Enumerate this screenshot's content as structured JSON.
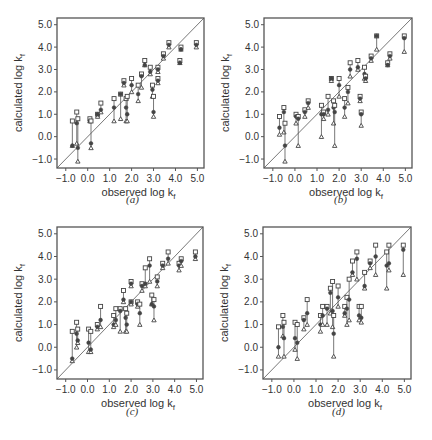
{
  "chart_data": [
    {
      "id": "a",
      "type": "scatter",
      "caption": "(a)",
      "xlabel": "observed log k_f",
      "ylabel": "calculated log k_f",
      "xlim": [
        -1.4,
        5.3
      ],
      "ylim": [
        -1.4,
        5.3
      ],
      "xticks": [
        "-1.0",
        "0.0",
        "1.0",
        "2.0",
        "3.0",
        "4.0",
        "5.0"
      ],
      "yticks": [
        "-1.0",
        "0.0",
        "1.0",
        "2.0",
        "3.0",
        "4.0",
        "5.0"
      ],
      "diagonal": true,
      "grid": false,
      "points": [
        {
          "x": -0.7,
          "hi": 0.7,
          "mid": -0.4,
          "lo": -0.4
        },
        {
          "x": -0.5,
          "hi": 1.1,
          "mid": 0.6,
          "lo": -0.3
        },
        {
          "x": -0.45,
          "hi": 0.8,
          "mid": -0.5,
          "lo": -1.1
        },
        {
          "x": 0.1,
          "hi": 0.8,
          "mid": 0.7,
          "lo": 0.7
        },
        {
          "x": 0.15,
          "hi": 0.7,
          "mid": -0.3,
          "lo": -0.5
        },
        {
          "x": 0.45,
          "hi": 1.0,
          "mid": 1.0,
          "lo": 0.9
        },
        {
          "x": 0.6,
          "hi": 1.5,
          "mid": 1.2,
          "lo": 1.1
        },
        {
          "x": 1.2,
          "hi": 1.7,
          "mid": 1.3,
          "lo": 0.7
        },
        {
          "x": 1.5,
          "hi": 1.9,
          "mid": 1.9,
          "lo": 0.8
        },
        {
          "x": 1.65,
          "hi": 2.5,
          "mid": 2.4,
          "lo": 2.3
        },
        {
          "x": 1.75,
          "hi": 1.7,
          "mid": 1.3,
          "lo": 0.7
        },
        {
          "x": 1.8,
          "hi": 1.8,
          "mid": 1.0,
          "lo": 0.7
        },
        {
          "x": 2.0,
          "hi": 2.6,
          "mid": 2.3,
          "lo": 2.0
        },
        {
          "x": 2.3,
          "hi": 2.3,
          "mid": 1.9,
          "lo": 1.6
        },
        {
          "x": 2.45,
          "hi": 2.8,
          "mid": 2.7,
          "lo": 2.2
        },
        {
          "x": 2.6,
          "hi": 3.4,
          "mid": 3.2,
          "lo": 3.2
        },
        {
          "x": 2.85,
          "hi": 3.1,
          "mid": 2.9,
          "lo": 2.8
        },
        {
          "x": 2.95,
          "hi": 2.3,
          "mid": 2.1,
          "lo": 1.8
        },
        {
          "x": 3.0,
          "hi": 1.8,
          "mid": 1.1,
          "lo": 0.9
        },
        {
          "x": 3.2,
          "hi": 3.1,
          "mid": 3.0,
          "lo": 2.9
        },
        {
          "x": 3.2,
          "hi": 2.6,
          "mid": 2.5,
          "lo": 2.4
        },
        {
          "x": 3.45,
          "hi": 3.7,
          "mid": 3.6,
          "lo": 3.5
        },
        {
          "x": 3.7,
          "hi": 4.2,
          "mid": 4.1,
          "lo": 4.0
        },
        {
          "x": 4.2,
          "hi": 3.4,
          "mid": 3.3,
          "lo": 3.3
        },
        {
          "x": 4.25,
          "hi": 4.0,
          "mid": 3.9,
          "lo": 3.9
        },
        {
          "x": 4.95,
          "hi": 4.2,
          "mid": 4.1,
          "lo": 4.0
        }
      ]
    },
    {
      "id": "b",
      "type": "scatter",
      "caption": "(b)",
      "xlabel": "observed log k_f",
      "ylabel": "calculated log k_f",
      "xlim": [
        -1.4,
        5.3
      ],
      "ylim": [
        -1.4,
        5.3
      ],
      "xticks": [
        "-1.0",
        "0.0",
        "1.0",
        "2.0",
        "3.0",
        "4.0",
        "5.0"
      ],
      "yticks": [
        "-1.0",
        "0.0",
        "1.0",
        "2.0",
        "3.0",
        "4.0",
        "5.0"
      ],
      "diagonal": true,
      "grid": false,
      "points": [
        {
          "x": -0.7,
          "hi": 0.9,
          "mid": 0.4,
          "lo": 0.1
        },
        {
          "x": -0.5,
          "hi": 1.3,
          "mid": 1.1,
          "lo": 0.2
        },
        {
          "x": -0.45,
          "hi": 0.6,
          "mid": -0.4,
          "lo": -1.1
        },
        {
          "x": 0.05,
          "hi": 1.0,
          "mid": 0.9,
          "lo": 0.6
        },
        {
          "x": 0.15,
          "hi": 0.9,
          "mid": 0.8,
          "lo": -0.4
        },
        {
          "x": 0.45,
          "hi": 1.2,
          "mid": 1.1,
          "lo": 0.9
        },
        {
          "x": 0.6,
          "hi": 1.6,
          "mid": 1.5,
          "lo": 1.3
        },
        {
          "x": 1.2,
          "hi": 1.4,
          "mid": 1.0,
          "lo": 0.0
        },
        {
          "x": 1.3,
          "hi": 1.1,
          "mid": 1.0,
          "lo": 0.8
        },
        {
          "x": 1.5,
          "hi": 1.8,
          "mid": 1.2,
          "lo": 1.0
        },
        {
          "x": 1.65,
          "hi": 2.6,
          "mid": 2.6,
          "lo": 2.5
        },
        {
          "x": 1.75,
          "hi": 1.6,
          "mid": 1.3,
          "lo": 0.6
        },
        {
          "x": 1.8,
          "hi": 1.4,
          "mid": 1.1,
          "lo": -0.4
        },
        {
          "x": 2.0,
          "hi": 2.6,
          "mid": 2.3,
          "lo": 1.8
        },
        {
          "x": 2.25,
          "hi": 1.7,
          "mid": 1.3,
          "lo": 0.9
        },
        {
          "x": 2.4,
          "hi": 2.2,
          "mid": 2.0,
          "lo": 1.5
        },
        {
          "x": 2.5,
          "hi": 3.3,
          "mid": 3.0,
          "lo": 2.7
        },
        {
          "x": 2.85,
          "hi": 3.4,
          "mid": 3.1,
          "lo": 3.0
        },
        {
          "x": 2.95,
          "hi": 1.8,
          "mid": 1.7,
          "lo": 1.6
        },
        {
          "x": 3.0,
          "hi": 1.1,
          "mid": 1.0,
          "lo": 0.5
        },
        {
          "x": 3.15,
          "hi": 3.1,
          "mid": 2.8,
          "lo": 2.6
        },
        {
          "x": 3.2,
          "hi": 2.7,
          "mid": 2.6,
          "lo": 2.5
        },
        {
          "x": 3.45,
          "hi": 3.6,
          "mid": 3.5,
          "lo": 3.4
        },
        {
          "x": 3.7,
          "hi": 4.5,
          "mid": 4.5,
          "lo": 3.9
        },
        {
          "x": 4.2,
          "hi": 3.3,
          "mid": 3.2,
          "lo": 3.2
        },
        {
          "x": 4.3,
          "hi": 3.7,
          "mid": 3.6,
          "lo": 3.5
        },
        {
          "x": 4.95,
          "hi": 4.5,
          "mid": 4.4,
          "lo": 3.8
        }
      ]
    },
    {
      "id": "c",
      "type": "scatter",
      "caption": "(c)",
      "xlabel": "observed log k_f",
      "ylabel": "calculated log k_f",
      "xlim": [
        -1.4,
        5.3
      ],
      "ylim": [
        -1.4,
        5.3
      ],
      "xticks": [
        "-1.0",
        "0.0",
        "1.0",
        "2.0",
        "3.0",
        "4.0",
        "5.0"
      ],
      "yticks": [
        "-1.0",
        "0.0",
        "1.0",
        "2.0",
        "3.0",
        "4.0",
        "5.0"
      ],
      "diagonal": true,
      "grid": false,
      "points": [
        {
          "x": -0.7,
          "hi": 0.7,
          "mid": -0.5,
          "lo": -0.6
        },
        {
          "x": -0.5,
          "hi": 1.1,
          "mid": 0.6,
          "lo": 0.0
        },
        {
          "x": -0.45,
          "hi": 0.8,
          "mid": 0.3,
          "lo": 0.2
        },
        {
          "x": 0.05,
          "hi": 0.8,
          "mid": 0.2,
          "lo": -0.2
        },
        {
          "x": 0.15,
          "hi": 0.7,
          "mid": -0.1,
          "lo": -0.2
        },
        {
          "x": 0.45,
          "hi": 1.0,
          "mid": 0.9,
          "lo": 0.8
        },
        {
          "x": 0.6,
          "hi": 1.8,
          "mid": 1.2,
          "lo": 0.9
        },
        {
          "x": 1.2,
          "hi": 1.4,
          "mid": 1.0,
          "lo": 0.9
        },
        {
          "x": 1.3,
          "hi": 1.7,
          "mid": 1.2,
          "lo": 1.0
        },
        {
          "x": 1.5,
          "hi": 1.7,
          "mid": 1.6,
          "lo": 0.7
        },
        {
          "x": 1.65,
          "hi": 2.5,
          "mid": 2.1,
          "lo": 2.0
        },
        {
          "x": 1.75,
          "hi": 1.7,
          "mid": 1.3,
          "lo": 0.7
        },
        {
          "x": 1.8,
          "hi": 1.5,
          "mid": 1.0,
          "lo": 0.7
        },
        {
          "x": 2.0,
          "hi": 2.9,
          "mid": 2.8,
          "lo": 2.7
        },
        {
          "x": 2.0,
          "hi": 2.0,
          "mid": 2.0,
          "lo": 1.9
        },
        {
          "x": 2.3,
          "hi": 2.0,
          "mid": 1.9,
          "lo": 1.8
        },
        {
          "x": 2.4,
          "hi": 1.9,
          "mid": 1.5,
          "lo": 1.0
        },
        {
          "x": 2.5,
          "hi": 2.8,
          "mid": 2.7,
          "lo": 2.5
        },
        {
          "x": 2.65,
          "hi": 3.5,
          "mid": 2.8,
          "lo": 2.7
        },
        {
          "x": 2.85,
          "hi": 3.9,
          "mid": 3.6,
          "lo": 2.9
        },
        {
          "x": 2.95,
          "hi": 2.3,
          "mid": 1.9,
          "lo": 1.9
        },
        {
          "x": 3.05,
          "hi": 2.1,
          "mid": 1.8,
          "lo": 1.2
        },
        {
          "x": 3.2,
          "hi": 3.1,
          "mid": 2.9,
          "lo": 2.7
        },
        {
          "x": 3.45,
          "hi": 3.7,
          "mid": 3.6,
          "lo": 3.5
        },
        {
          "x": 3.7,
          "hi": 4.2,
          "mid": 3.9,
          "lo": 3.7
        },
        {
          "x": 4.2,
          "hi": 3.7,
          "mid": 3.6,
          "lo": 3.4
        },
        {
          "x": 4.3,
          "hi": 3.9,
          "mid": 3.8,
          "lo": 3.6
        },
        {
          "x": 4.95,
          "hi": 4.2,
          "mid": 4.0,
          "lo": 3.9
        }
      ]
    },
    {
      "id": "d",
      "type": "scatter",
      "caption": "(d)",
      "xlabel": "observed log k_f",
      "ylabel": "calculated log k_f",
      "xlim": [
        -1.4,
        5.3
      ],
      "ylim": [
        -1.4,
        5.3
      ],
      "xticks": [
        "-1.0",
        "0.0",
        "1.0",
        "2.0",
        "3.0",
        "4.0",
        "5.0"
      ],
      "yticks": [
        "-1.0",
        "0.0",
        "1.0",
        "2.0",
        "3.0",
        "4.0",
        "5.0"
      ],
      "diagonal": true,
      "grid": false,
      "points": [
        {
          "x": -0.7,
          "hi": 0.9,
          "mid": 0.0,
          "lo": -0.4
        },
        {
          "x": -0.5,
          "hi": 1.4,
          "mid": 0.9,
          "lo": 0.5
        },
        {
          "x": -0.45,
          "hi": 1.1,
          "mid": 0.4,
          "lo": -0.4
        },
        {
          "x": 0.05,
          "hi": 1.1,
          "mid": 0.4,
          "lo": -0.1
        },
        {
          "x": 0.15,
          "hi": 1.0,
          "mid": 0.2,
          "lo": -0.5
        },
        {
          "x": 0.45,
          "hi": 1.3,
          "mid": 1.2,
          "lo": 0.8
        },
        {
          "x": 0.6,
          "hi": 2.1,
          "mid": 1.5,
          "lo": 1.0
        },
        {
          "x": 1.2,
          "hi": 1.4,
          "mid": 1.0,
          "lo": 0.7
        },
        {
          "x": 1.3,
          "hi": 1.8,
          "mid": 1.4,
          "lo": 1.0
        },
        {
          "x": 1.5,
          "hi": 1.8,
          "mid": 1.7,
          "lo": 1.0
        },
        {
          "x": 1.65,
          "hi": 2.6,
          "mid": 2.4,
          "lo": 1.5
        },
        {
          "x": 1.75,
          "hi": 2.9,
          "mid": 1.6,
          "lo": 0.9
        },
        {
          "x": 1.8,
          "hi": 1.4,
          "mid": 0.6,
          "lo": -0.4
        },
        {
          "x": 2.0,
          "hi": 2.7,
          "mid": 2.2,
          "lo": 1.8
        },
        {
          "x": 2.3,
          "hi": 1.8,
          "mid": 1.5,
          "lo": 1.4
        },
        {
          "x": 2.4,
          "hi": 2.2,
          "mid": 1.7,
          "lo": 1.0
        },
        {
          "x": 2.5,
          "hi": 3.0,
          "mid": 2.1,
          "lo": 1.2
        },
        {
          "x": 2.65,
          "hi": 3.8,
          "mid": 3.3,
          "lo": 3.2
        },
        {
          "x": 2.85,
          "hi": 4.2,
          "mid": 3.9,
          "lo": 3.0
        },
        {
          "x": 2.95,
          "hi": 1.8,
          "mid": 1.4,
          "lo": 1.2
        },
        {
          "x": 3.05,
          "hi": 1.8,
          "mid": 1.3,
          "lo": 1.1
        },
        {
          "x": 3.2,
          "hi": 3.3,
          "mid": 2.7,
          "lo": 2.6
        },
        {
          "x": 3.45,
          "hi": 3.8,
          "mid": 3.7,
          "lo": 3.5
        },
        {
          "x": 3.7,
          "hi": 4.5,
          "mid": 4.0,
          "lo": 3.2
        },
        {
          "x": 4.2,
          "hi": 4.2,
          "mid": 3.6,
          "lo": 2.6
        },
        {
          "x": 4.3,
          "hi": 4.5,
          "mid": 3.7,
          "lo": 3.4
        },
        {
          "x": 4.95,
          "hi": 4.5,
          "mid": 4.3,
          "lo": 3.2
        }
      ]
    }
  ],
  "panels": [
    {
      "caption": "(a)",
      "xlabel_main": "observed log k",
      "xlabel_sub": "f",
      "ylabel_main": "calculated log k",
      "ylabel_sub": "f"
    },
    {
      "caption": "(b)",
      "xlabel_main": "observed log k",
      "xlabel_sub": "f",
      "ylabel_main": "calculated log k",
      "ylabel_sub": "f"
    },
    {
      "caption": "(c)",
      "xlabel_main": "observed log k",
      "xlabel_sub": "f",
      "ylabel_main": "calculated log k",
      "ylabel_sub": "f"
    },
    {
      "caption": "(d)",
      "xlabel_main": "observed log k",
      "xlabel_sub": "f",
      "ylabel_main": "calculated log k",
      "ylabel_sub": "f"
    }
  ],
  "style": {
    "axis_color": "#555555",
    "marker_color": "#444444",
    "line_color": "#555555",
    "background": "#ffffff"
  }
}
